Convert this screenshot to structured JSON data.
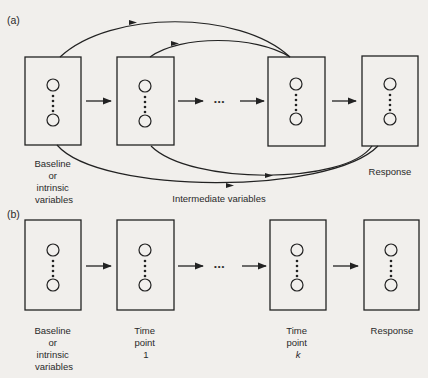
{
  "panels": [
    {
      "id": "a",
      "label": "(a)",
      "boxes": [
        {
          "name": "baseline",
          "caption_lines": [
            "Baseline",
            "or",
            "intrinsic",
            "variables"
          ]
        },
        {
          "name": "time-point-1",
          "caption_lines": []
        },
        {
          "name": "time-point-k",
          "caption_lines": []
        },
        {
          "name": "response",
          "caption_lines": [
            "Response"
          ]
        }
      ],
      "ellipsis": "•••",
      "curved_arrows_label": "Intermediate variables"
    },
    {
      "id": "b",
      "label": "(b)",
      "boxes": [
        {
          "name": "baseline",
          "caption_lines": [
            "Baseline",
            "or",
            "intrinsic",
            "variables"
          ]
        },
        {
          "name": "time-point-1",
          "caption_lines": [
            "Time",
            "point",
            "1"
          ]
        },
        {
          "name": "time-point-k",
          "caption_lines": [
            "Time",
            "point",
            "k"
          ]
        },
        {
          "name": "response",
          "caption_lines": [
            "Response"
          ]
        }
      ],
      "ellipsis": "•••"
    }
  ]
}
